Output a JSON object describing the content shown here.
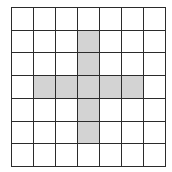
{
  "figure": {
    "type": "grid-diagram",
    "rows": 7,
    "cols": 7,
    "colors": {
      "line": "#2b2b2b",
      "shaded": "#d3d3d3",
      "empty": "#ffffff"
    },
    "shaded_cells": [
      [
        1,
        3
      ],
      [
        2,
        3
      ],
      [
        3,
        1
      ],
      [
        3,
        2
      ],
      [
        3,
        3
      ],
      [
        3,
        4
      ],
      [
        3,
        5
      ],
      [
        4,
        3
      ],
      [
        5,
        3
      ]
    ]
  }
}
